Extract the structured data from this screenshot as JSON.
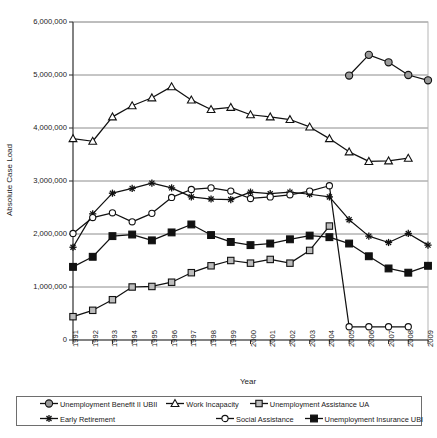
{
  "chart_data": {
    "type": "line",
    "title": "",
    "xlabel": "Year",
    "ylabel": "Absolute Case Load",
    "x": [
      1991,
      1992,
      1993,
      1994,
      1995,
      1996,
      1997,
      1998,
      1999,
      2000,
      2001,
      2002,
      2003,
      2004,
      2005,
      2006,
      2007,
      2008,
      2009
    ],
    "categories": [
      "1991",
      "1992",
      "1993",
      "1994",
      "1995",
      "1996",
      "1997",
      "1998",
      "1999",
      "2000",
      "2001",
      "2002",
      "2003",
      "2004",
      "2005",
      "2006",
      "2007",
      "2008",
      "2009"
    ],
    "ylim": [
      0,
      6000000
    ],
    "ytick_labels": [
      "6,000,000",
      "5,000,000",
      "4,000,000",
      "3,000,000",
      "2,000,000",
      "1,000,000",
      "0"
    ],
    "ytick_values": [
      6000000,
      5000000,
      4000000,
      3000000,
      2000000,
      1000000,
      0
    ],
    "grid": true,
    "legend_position": "bottom",
    "series": [
      {
        "name": "Unemployment Benefit II UBII",
        "marker": "circle-dark-gray",
        "color": "#111111",
        "x": [
          2005,
          2006,
          2007,
          2008,
          2009
        ],
        "values": [
          4990000,
          5380000,
          5240000,
          5000000,
          4900000
        ]
      },
      {
        "name": "Work Incapacity",
        "marker": "triangle-open",
        "color": "#111111",
        "x": [
          1991,
          1992,
          1993,
          1994,
          1995,
          1996,
          1997,
          1998,
          1999,
          2000,
          2001,
          2002,
          2003,
          2004,
          2005,
          2006,
          2007,
          2008
        ],
        "values": [
          3800000,
          3750000,
          4210000,
          4420000,
          4570000,
          4780000,
          4530000,
          4350000,
          4390000,
          4250000,
          4210000,
          4160000,
          4020000,
          3800000,
          3550000,
          3370000,
          3380000,
          3430000
        ]
      },
      {
        "name": "Unemployment Assistance UA",
        "marker": "square-gray",
        "color": "#111111",
        "x": [
          1991,
          1992,
          1993,
          1994,
          1995,
          1996,
          1997,
          1998,
          1999,
          2000,
          2001,
          2002,
          2003,
          2004
        ],
        "values": [
          440000,
          560000,
          760000,
          1000000,
          1010000,
          1090000,
          1270000,
          1400000,
          1500000,
          1450000,
          1520000,
          1450000,
          1690000,
          2150000
        ]
      },
      {
        "name": "Early Retirement",
        "marker": "asterisk",
        "color": "#111111",
        "x": [
          1991,
          1992,
          1993,
          1994,
          1995,
          1996,
          1997,
          1998,
          1999,
          2000,
          2001,
          2002,
          2003,
          2004,
          2005,
          2006,
          2007,
          2008,
          2009
        ],
        "values": [
          1750000,
          2380000,
          2770000,
          2860000,
          2960000,
          2870000,
          2700000,
          2660000,
          2650000,
          2790000,
          2760000,
          2790000,
          2750000,
          2700000,
          2270000,
          1960000,
          1840000,
          2010000,
          1790000
        ]
      },
      {
        "name": "Social Assistance",
        "marker": "circle-open",
        "color": "#111111",
        "x": [
          1991,
          1992,
          1993,
          1994,
          1995,
          1996,
          1997,
          1998,
          1999,
          2000,
          2001,
          2002,
          2003,
          2004,
          2005,
          2006,
          2007,
          2008
        ],
        "values": [
          2010000,
          2310000,
          2400000,
          2230000,
          2390000,
          2690000,
          2840000,
          2870000,
          2810000,
          2670000,
          2700000,
          2740000,
          2810000,
          2910000,
          250000,
          250000,
          250000,
          250000
        ]
      },
      {
        "name": "Unemployment Insurance UBI",
        "marker": "square-black",
        "color": "#111111",
        "x": [
          1991,
          1992,
          1993,
          1994,
          1995,
          1996,
          1997,
          1998,
          1999,
          2000,
          2001,
          2002,
          2003,
          2004,
          2005,
          2006,
          2007,
          2008,
          2009
        ],
        "values": [
          1380000,
          1570000,
          1960000,
          1990000,
          1880000,
          2030000,
          2180000,
          1980000,
          1850000,
          1790000,
          1820000,
          1900000,
          1970000,
          1940000,
          1820000,
          1580000,
          1350000,
          1270000,
          1400000
        ]
      }
    ]
  },
  "legend": {
    "items": [
      {
        "label": "Unemployment Benefit II UBII",
        "marker": "circle-dark-gray"
      },
      {
        "label": "Work Incapacity",
        "marker": "triangle-open"
      },
      {
        "label": "Unemployment Assistance UA",
        "marker": "square-gray"
      },
      {
        "label": "Early Retirement",
        "marker": "asterisk"
      },
      {
        "label": "Social Assistance",
        "marker": "circle-open"
      },
      {
        "label": "Unemployment Insurance UBI",
        "marker": "square-black"
      }
    ]
  }
}
